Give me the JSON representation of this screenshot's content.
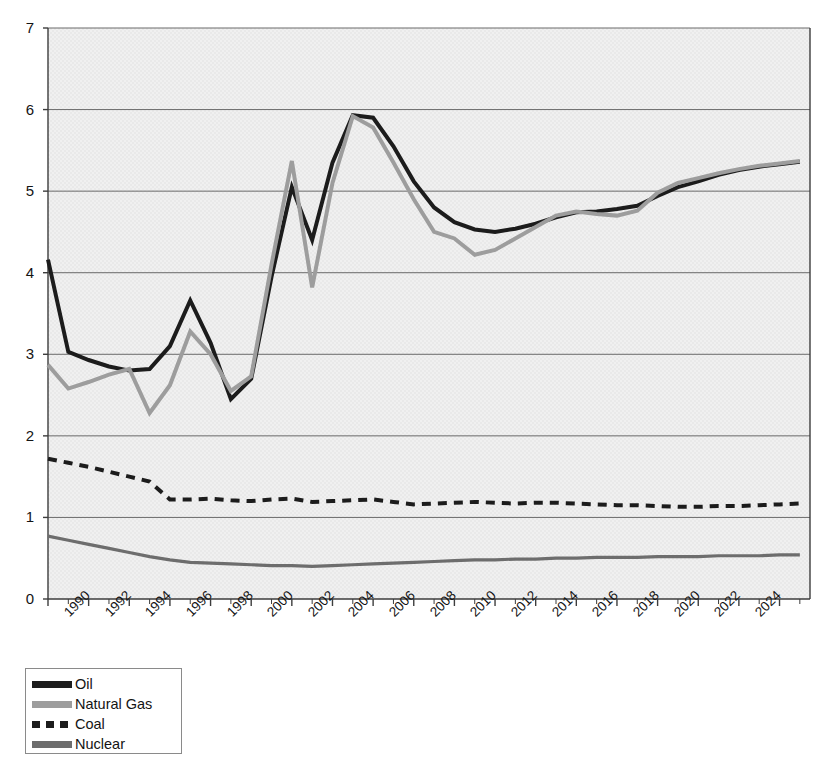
{
  "chart_data": {
    "type": "line",
    "title": "",
    "subtitle": "",
    "xlabel": "",
    "ylabel": "",
    "xlim": [
      1990,
      2027.5
    ],
    "ylim": [
      0,
      7
    ],
    "yticks": [
      0,
      1,
      2,
      3,
      4,
      5,
      6,
      7
    ],
    "ytick_labels": [
      "0",
      "1",
      "2",
      "3",
      "4",
      "5",
      "6",
      "7"
    ],
    "xticks": [
      1990,
      1992,
      1994,
      1996,
      1998,
      2000,
      2002,
      2004,
      2006,
      2008,
      2010,
      2012,
      2014,
      2016,
      2018,
      2020,
      2022,
      2024
    ],
    "xtick_labels": [
      "1990",
      "1992",
      "1994",
      "1996",
      "1998",
      "2000",
      "2002",
      "2004",
      "2006",
      "2008",
      "2010",
      "2012",
      "2014",
      "2016",
      "2018",
      "2020",
      "2022",
      "2024"
    ],
    "xtick_rotation": -45,
    "minor_xtick_interval": 1,
    "grid": "horizontal",
    "grid_color": "#6a6a6a",
    "plot_background": "#e9e9e9",
    "legend_position": "below-left",
    "x": [
      1990,
      1991,
      1992,
      1993,
      1994,
      1995,
      1996,
      1997,
      1998,
      1999,
      2000,
      2001,
      2002,
      2003,
      2004,
      2005,
      2006,
      2007,
      2008,
      2009,
      2010,
      2011,
      2012,
      2013,
      2014,
      2015,
      2016,
      2017,
      2018,
      2019,
      2020,
      2021,
      2022,
      2023,
      2024,
      2025,
      2026,
      2027
    ],
    "series": [
      {
        "name": "Oil",
        "color": "#1c1c1c",
        "style": "solid",
        "width": 4.0,
        "values": [
          4.16,
          3.03,
          2.93,
          2.85,
          2.8,
          2.82,
          3.1,
          3.66,
          3.14,
          2.45,
          2.7,
          3.95,
          5.05,
          4.4,
          5.35,
          5.93,
          5.9,
          5.55,
          5.12,
          4.8,
          4.62,
          4.53,
          4.5,
          4.54,
          4.6,
          4.68,
          4.74,
          4.75,
          4.78,
          4.82,
          4.94,
          5.05,
          5.12,
          5.2,
          5.26,
          5.3,
          5.33,
          5.36
        ]
      },
      {
        "name": "Natural Gas",
        "color": "#9d9d9d",
        "style": "solid",
        "width": 4.0,
        "values": [
          2.87,
          2.58,
          2.66,
          2.75,
          2.82,
          2.28,
          2.62,
          3.28,
          3.0,
          2.55,
          2.73,
          4.1,
          5.37,
          3.82,
          5.1,
          5.92,
          5.78,
          5.35,
          4.9,
          4.5,
          4.42,
          4.22,
          4.28,
          4.42,
          4.56,
          4.7,
          4.75,
          4.72,
          4.7,
          4.76,
          4.98,
          5.1,
          5.16,
          5.22,
          5.27,
          5.31,
          5.34,
          5.37
        ]
      },
      {
        "name": "Coal",
        "color": "#1c1c1c",
        "style": "dashed",
        "width": 4.0,
        "values": [
          1.72,
          1.67,
          1.62,
          1.56,
          1.5,
          1.44,
          1.22,
          1.22,
          1.23,
          1.21,
          1.2,
          1.22,
          1.23,
          1.19,
          1.2,
          1.21,
          1.22,
          1.19,
          1.16,
          1.17,
          1.18,
          1.19,
          1.18,
          1.17,
          1.18,
          1.18,
          1.17,
          1.16,
          1.15,
          1.15,
          1.14,
          1.13,
          1.13,
          1.14,
          1.14,
          1.15,
          1.16,
          1.17
        ]
      },
      {
        "name": "Nuclear",
        "color": "#6d6d6d",
        "style": "solid",
        "width": 3.2,
        "values": [
          0.77,
          0.72,
          0.67,
          0.62,
          0.57,
          0.52,
          0.48,
          0.45,
          0.44,
          0.43,
          0.42,
          0.41,
          0.41,
          0.4,
          0.41,
          0.42,
          0.43,
          0.44,
          0.45,
          0.46,
          0.47,
          0.48,
          0.48,
          0.49,
          0.49,
          0.5,
          0.5,
          0.51,
          0.51,
          0.51,
          0.52,
          0.52,
          0.52,
          0.53,
          0.53,
          0.53,
          0.54,
          0.54
        ]
      }
    ]
  },
  "legend": {
    "items": [
      {
        "label": "Oil",
        "swatch": "solid-black"
      },
      {
        "label": "Natural Gas",
        "swatch": "solid-lightgray"
      },
      {
        "label": "Coal",
        "swatch": "dashed-black"
      },
      {
        "label": "Nuclear",
        "swatch": "solid-gray"
      }
    ]
  }
}
